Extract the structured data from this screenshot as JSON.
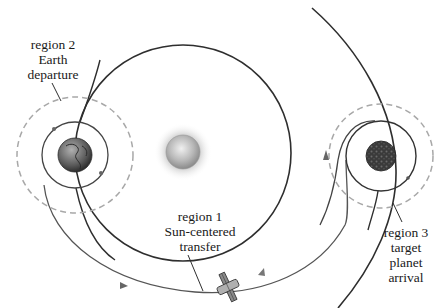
{
  "bodies": {
    "sun": {
      "name": "Sun",
      "cx": 183,
      "cy": 152,
      "r": 16
    },
    "earth": {
      "name": "Earth",
      "cx": 75,
      "cy": 155,
      "r": 17,
      "parking_r": 33,
      "soi_r": 58
    },
    "target": {
      "name": "target planet",
      "cx": 381,
      "cy": 156,
      "r": 15,
      "parking_r": 35,
      "soi_r": 52
    }
  },
  "orbits": {
    "earth_orbit": {
      "cx": 183,
      "cy": 153,
      "r": 108
    },
    "target_orbit_arc": "outer arc"
  },
  "labels": {
    "region2": {
      "line1": "region 2",
      "line2": "Earth",
      "line3": "departure"
    },
    "region1": {
      "line1": "region 1",
      "line2": "Sun-centered",
      "line3": "transfer"
    },
    "region3": {
      "line1": "region 3",
      "line2": "target",
      "line3": "planet",
      "line4": "arrival"
    }
  },
  "colors": {
    "line": "#2e2e2e",
    "dashed": "#a8a8a8",
    "transfer": "#555555",
    "earth": "#6a6a6a",
    "planet": "#3a3a3a"
  }
}
